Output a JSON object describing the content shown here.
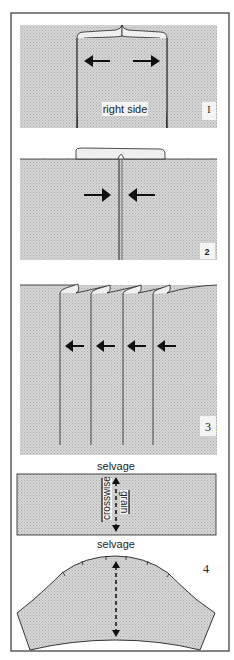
{
  "figure": {
    "type": "sewing-instruction-diagram",
    "colors": {
      "fabric": "#cfcfcf",
      "line": "#222222",
      "frame": "#333333",
      "background": "#ffffff"
    },
    "panels": [
      {
        "step": "1",
        "step_label": "I",
        "description": "seam pressed open, arrows pointing outward",
        "text": "right side",
        "arrows": [
          "left",
          "right"
        ]
      },
      {
        "step": "2",
        "step_label": "2",
        "description": "seam allowances pressed, arrows pointing inward to seam",
        "arrows": [
          "right",
          "left"
        ]
      },
      {
        "step": "3",
        "step_label": "3",
        "description": "series of four tucks, arrows pointing left",
        "arrows": [
          "left",
          "left",
          "left",
          "left"
        ]
      },
      {
        "step": "4",
        "step_label": "4",
        "description": "fabric strip and cut shape with crosswise grain",
        "strip": {
          "top_label": "selvage",
          "bottom_label": "selvage",
          "grain_label_1": "crosswise",
          "grain_label_2": "grain"
        }
      }
    ]
  }
}
